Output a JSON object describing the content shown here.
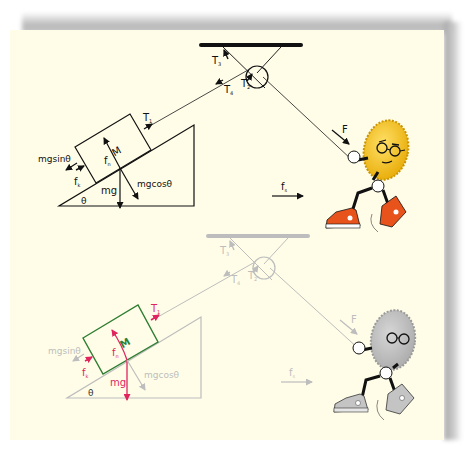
{
  "colors": {
    "background": "#fffde8",
    "ink": "#111111",
    "faded": "#bdbdbd",
    "highlight_block": "#2e7d32",
    "highlight_force": "#e0245e",
    "character_body_top": "#f5c518",
    "character_body_bottom": "#bdbdbd",
    "shoe_top": "#e8531c",
    "shoe_bottom": "#c4c4c4"
  },
  "top_diagram": {
    "labels": {
      "mass": "M",
      "tension_block": "T",
      "tension_block_sub": "1",
      "tension_pulley": "T",
      "tension_pulley_sub": "2",
      "tension_ceiling": "T",
      "tension_ceiling_sub": "3",
      "tension_rope": "T",
      "tension_rope_sub": "4",
      "normal_force": "f",
      "normal_force_sub": "n",
      "friction": "f",
      "friction_sub": "k",
      "weight": "mg",
      "parallel_component": "mgsinθ",
      "perpendicular_component": "mgcosθ",
      "angle": "θ",
      "applied_force": "F",
      "static_friction": "f",
      "static_friction_sub": "s"
    }
  },
  "bottom_diagram": {
    "labels": {
      "mass": "M",
      "tension_block": "T",
      "tension_block_sub": "1",
      "tension_pulley": "T",
      "tension_pulley_sub": "2",
      "tension_ceiling": "T",
      "tension_ceiling_sub": "3",
      "tension_rope": "T",
      "tension_rope_sub": "4",
      "normal_force": "f",
      "normal_force_sub": "n",
      "friction": "f",
      "friction_sub": "k",
      "weight": "mg",
      "parallel_component": "mgsinθ",
      "perpendicular_component": "mgcosθ",
      "angle": "θ",
      "applied_force": "F",
      "static_friction": "f",
      "static_friction_sub": "s"
    }
  }
}
